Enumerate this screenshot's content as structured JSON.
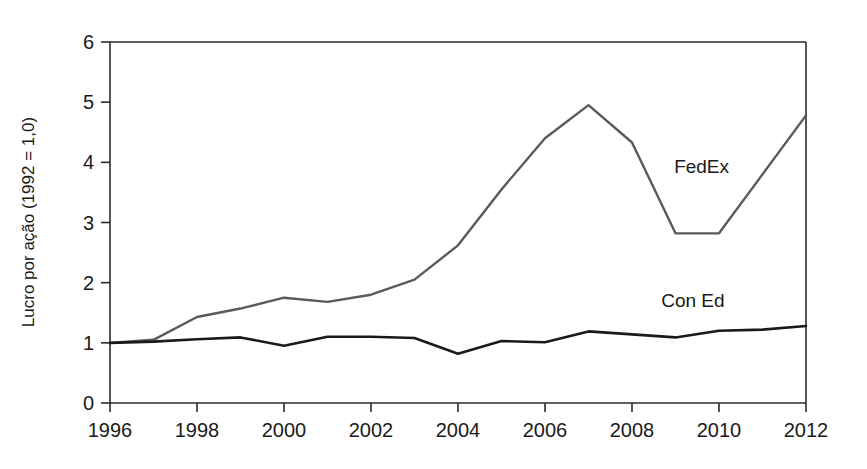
{
  "chart_data": {
    "type": "line",
    "title": "",
    "subtitle": "",
    "xlabel": "",
    "ylabel": "Lucro por ação (1992 = 1,0)",
    "xlim": [
      1996,
      2012
    ],
    "ylim": [
      0,
      6
    ],
    "grid": false,
    "legend_position": "inline-annotation",
    "x_ticks": [
      "1996",
      "1998",
      "2000",
      "2002",
      "2004",
      "2006",
      "2008",
      "2010",
      "2012"
    ],
    "x_tick_values": [
      1996,
      1998,
      2000,
      2002,
      2004,
      2006,
      2008,
      2010,
      2012
    ],
    "y_ticks": [
      "0",
      "1",
      "2",
      "3",
      "4",
      "5",
      "6"
    ],
    "y_tick_values": [
      0,
      1,
      2,
      3,
      4,
      5,
      6
    ],
    "x": [
      1996,
      1997,
      1998,
      1999,
      2000,
      2001,
      2002,
      2003,
      2004,
      2005,
      2006,
      2007,
      2008,
      2009,
      2010,
      2011,
      2012
    ],
    "series": [
      {
        "name": "FedEx",
        "color": "#5a5a5a",
        "stroke_width": 2.4,
        "label_x": 2009.6,
        "label_y": 3.82,
        "values": [
          1.0,
          1.05,
          1.43,
          1.57,
          1.75,
          1.68,
          1.8,
          2.05,
          2.62,
          3.55,
          4.4,
          4.95,
          4.33,
          2.82,
          2.82,
          3.8,
          4.78
        ]
      },
      {
        "name": "Con Ed",
        "color": "#1a1a1a",
        "stroke_width": 2.6,
        "label_x": 2009.4,
        "label_y": 1.6,
        "values": [
          1.0,
          1.02,
          1.06,
          1.09,
          0.95,
          1.1,
          1.1,
          1.08,
          0.82,
          1.03,
          1.01,
          1.19,
          1.14,
          1.09,
          1.2,
          1.22,
          1.28
        ]
      }
    ]
  },
  "axes": {
    "y_axis_title": "Lucro por ação (1992 = 1,0)"
  },
  "colors": {
    "fedex": "#5a5a5a",
    "con_ed": "#1a1a1a",
    "axis": "#2b2b2b",
    "background": "#ffffff"
  }
}
